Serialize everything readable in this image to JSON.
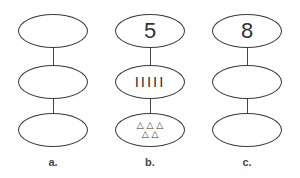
{
  "columns": [
    {
      "label": "a.",
      "top": "",
      "middle": "",
      "bottom_row1": "",
      "bottom_row2": ""
    },
    {
      "label": "b.",
      "top": "5",
      "middle": "IIIII",
      "bottom_row1": "△ △ △",
      "bottom_row2": "△ △"
    },
    {
      "label": "c.",
      "top": "8",
      "middle": "",
      "bottom_row1": "",
      "bottom_row2": ""
    }
  ]
}
